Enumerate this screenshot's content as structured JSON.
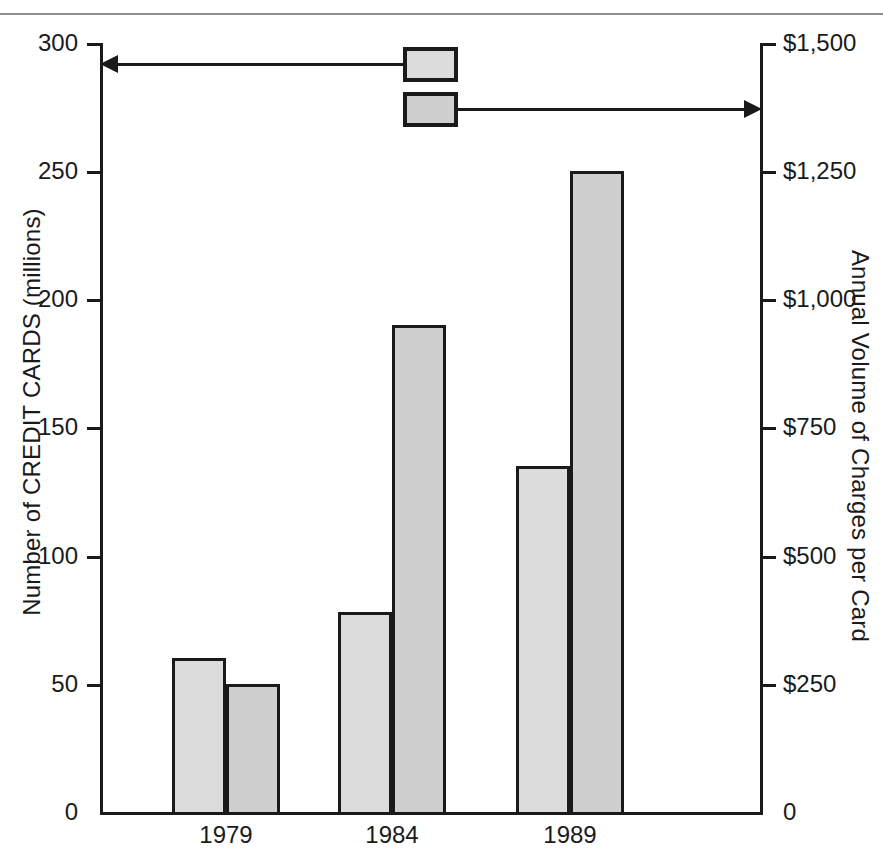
{
  "chart_data": {
    "type": "bar",
    "title": "",
    "categories": [
      "1979",
      "1984",
      "1989"
    ],
    "series": [
      {
        "name": "Number of CREDIT CARDS (millions)",
        "axis": "left",
        "key": "cards",
        "values": [
          60,
          78,
          135
        ],
        "color": "#dcdcdc"
      },
      {
        "name": "Annual Volume of Charges per Card",
        "axis": "right",
        "key": "charges",
        "values": [
          250,
          950,
          1250
        ],
        "color": "#cfcfcf"
      }
    ],
    "xlabel": "",
    "ylabel": "Number of CREDIT CARDS (millions)",
    "y2label": "Annual Volume of Charges per Card",
    "ylim": [
      0,
      300
    ],
    "y2lim": [
      0,
      1500
    ],
    "yticks": [
      "0",
      "50",
      "100",
      "150",
      "200",
      "250",
      "300"
    ],
    "y2ticks": [
      "0",
      "$250",
      "$500",
      "$750",
      "$1,000",
      "$1,250",
      "$1,500"
    ],
    "grid": false,
    "legend_position": "top-center-with-leader-arrows"
  },
  "axes": {
    "left": {
      "title": "Number of CREDIT CARDS (millions)",
      "ticks": [
        {
          "label": "300",
          "value": 300
        },
        {
          "label": "250",
          "value": 250
        },
        {
          "label": "200",
          "value": 200
        },
        {
          "label": "150",
          "value": 150
        },
        {
          "label": "100",
          "value": 100
        },
        {
          "label": "50",
          "value": 50
        },
        {
          "label": "0",
          "value": 0
        }
      ]
    },
    "right": {
      "title": "Annual Volume of Charges per Card",
      "ticks": [
        {
          "label": "$1,500",
          "value": 1500
        },
        {
          "label": "$1,250",
          "value": 1250
        },
        {
          "label": "$1,000",
          "value": 1000
        },
        {
          "label": "$750",
          "value": 750
        },
        {
          "label": "$500",
          "value": 500
        },
        {
          "label": "$250",
          "value": 250
        },
        {
          "label": "0",
          "value": 0
        }
      ]
    },
    "categories": [
      "1979",
      "1984",
      "1989"
    ]
  },
  "legend": {
    "entries": [
      {
        "label": "",
        "points_to": "left-axis",
        "color": "#dcdcdc"
      },
      {
        "label": "",
        "points_to": "right-axis",
        "color": "#cfcfcf"
      }
    ]
  },
  "caption_sliver": ""
}
